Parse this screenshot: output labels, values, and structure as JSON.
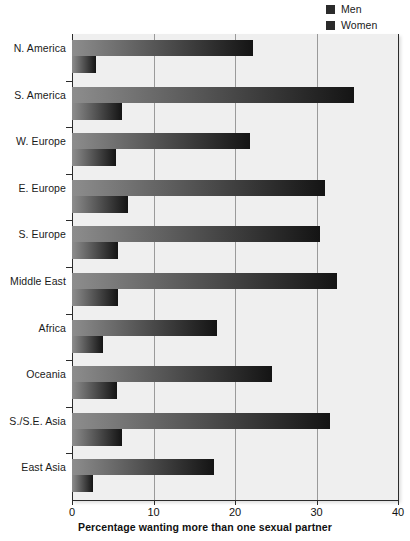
{
  "chart_data": {
    "type": "bar",
    "orientation": "horizontal",
    "title": "",
    "xlabel": "Percentage wanting more than one sexual partner",
    "ylabel": "",
    "xlim": [
      0,
      40
    ],
    "xticks": [
      0,
      10,
      20,
      30,
      40
    ],
    "xticklabels": [
      "0",
      "10",
      "20",
      "30",
      "40"
    ],
    "grid": true,
    "grid_axis": "x",
    "legend_position": "top-right",
    "categories": [
      "N. America",
      "S. America",
      "W. Europe",
      "E. Europe",
      "S. Europe",
      "Middle East",
      "Africa",
      "Oceania",
      "S./S.E. Asia",
      "East Asia"
    ],
    "series": [
      {
        "name": "Men",
        "values": [
          22.2,
          34.6,
          21.8,
          31.0,
          30.4,
          32.5,
          17.8,
          24.5,
          31.6,
          17.4
        ]
      },
      {
        "name": "Women",
        "values": [
          2.9,
          6.1,
          5.4,
          6.9,
          5.6,
          5.6,
          3.8,
          5.5,
          6.1,
          2.6
        ]
      }
    ]
  },
  "legend": {
    "items": [
      {
        "label": "Men",
        "color": "#2b2b2b"
      },
      {
        "label": "Women",
        "color": "#2b2b2b"
      }
    ]
  },
  "colors": {
    "plot_background": "#efefef",
    "gridline": "#9a9a9a",
    "axis": "#2b2b2b",
    "bar_gradient_start": "#8d8d8d",
    "bar_gradient_end": "#141414",
    "page_background": "#ffffff",
    "text": "#1a1a1a"
  }
}
